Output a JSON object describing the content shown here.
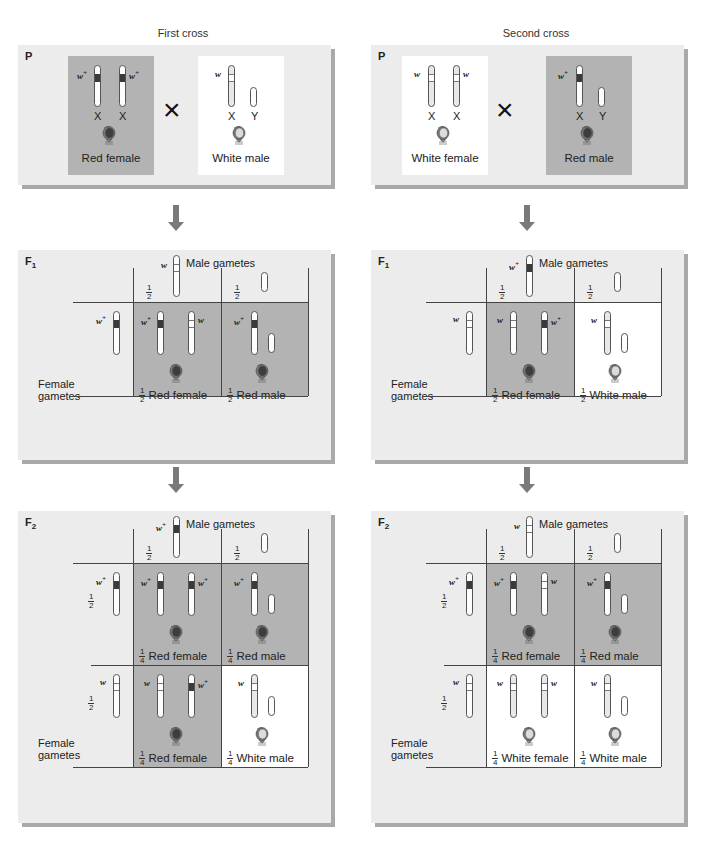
{
  "crosses": [
    {
      "title": "First cross",
      "P": {
        "label": "P",
        "female": {
          "phenotype": "Red female",
          "alleles": [
            "w+",
            "w+"
          ],
          "chromosomes": [
            "X",
            "X"
          ]
        },
        "male": {
          "phenotype": "White male",
          "alleles": [
            "w"
          ],
          "chromosomes": [
            "X",
            "Y"
          ]
        }
      },
      "F1": {
        "label": "F",
        "sub": "1",
        "male_gametes_label": "Male gametes",
        "female_gametes_label": "Female gametes",
        "male_gametes": [
          {
            "fraction": "1/2",
            "allele": "w"
          },
          {
            "fraction": "1/2",
            "allele": "Y"
          }
        ],
        "female_gametes": [
          {
            "allele": "w+"
          }
        ],
        "offspring": [
          {
            "fraction_num": "1",
            "fraction_den": "2",
            "phenotype": "Red female"
          },
          {
            "fraction_num": "1",
            "fraction_den": "2",
            "phenotype": "Red male"
          }
        ]
      },
      "F2": {
        "label": "F",
        "sub": "2",
        "male_gametes_label": "Male gametes",
        "female_gametes_label": "Female gametes",
        "male_gametes": [
          {
            "fraction": "1/2",
            "allele": "w+"
          },
          {
            "fraction": "1/2",
            "allele": "Y"
          }
        ],
        "female_gametes": [
          {
            "fraction": "1/2",
            "allele": "w+"
          },
          {
            "fraction": "1/2",
            "allele": "w"
          }
        ],
        "offspring": [
          {
            "fraction_num": "1",
            "fraction_den": "4",
            "phenotype": "Red female"
          },
          {
            "fraction_num": "1",
            "fraction_den": "4",
            "phenotype": "Red male"
          },
          {
            "fraction_num": "1",
            "fraction_den": "4",
            "phenotype": "Red female"
          },
          {
            "fraction_num": "1",
            "fraction_den": "4",
            "phenotype": "White male"
          }
        ]
      }
    },
    {
      "title": "Second cross",
      "P": {
        "label": "P",
        "female": {
          "phenotype": "White female",
          "alleles": [
            "w",
            "w"
          ],
          "chromosomes": [
            "X",
            "X"
          ]
        },
        "male": {
          "phenotype": "Red male",
          "alleles": [
            "w+"
          ],
          "chromosomes": [
            "X",
            "Y"
          ]
        }
      },
      "F1": {
        "label": "F",
        "sub": "1",
        "male_gametes_label": "Male gametes",
        "female_gametes_label": "Female gametes",
        "male_gametes": [
          {
            "fraction": "1/2",
            "allele": "w+"
          },
          {
            "fraction": "1/2",
            "allele": "Y"
          }
        ],
        "female_gametes": [
          {
            "allele": "w"
          }
        ],
        "offspring": [
          {
            "fraction_num": "1",
            "fraction_den": "2",
            "phenotype": "Red female"
          },
          {
            "fraction_num": "1",
            "fraction_den": "2",
            "phenotype": "White male"
          }
        ]
      },
      "F2": {
        "label": "F",
        "sub": "2",
        "male_gametes_label": "Male gametes",
        "female_gametes_label": "Female gametes",
        "male_gametes": [
          {
            "fraction": "1/2",
            "allele": "w"
          },
          {
            "fraction": "1/2",
            "allele": "Y"
          }
        ],
        "female_gametes": [
          {
            "fraction": "1/2",
            "allele": "w+"
          },
          {
            "fraction": "1/2",
            "allele": "w"
          }
        ],
        "offspring": [
          {
            "fraction_num": "1",
            "fraction_den": "4",
            "phenotype": "Red female"
          },
          {
            "fraction_num": "1",
            "fraction_den": "4",
            "phenotype": "Red male"
          },
          {
            "fraction_num": "1",
            "fraction_den": "4",
            "phenotype": "White female"
          },
          {
            "fraction_num": "1",
            "fraction_den": "4",
            "phenotype": "White male"
          }
        ]
      }
    }
  ],
  "symbols": {
    "cross": "×",
    "w": "w",
    "plus": "+",
    "X": "X",
    "Y": "Y",
    "half_num": "1",
    "half_den": "2"
  },
  "colors": {
    "panel_bg": "#ececec",
    "red_cell": "#b3b3b3",
    "white_cell": "#ffffff",
    "red_band": "#3a3a3a",
    "arrow": "#7a7a7a"
  }
}
